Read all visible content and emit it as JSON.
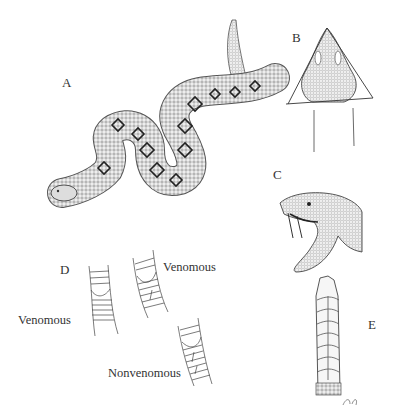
{
  "figure": {
    "panels": {
      "A": {
        "label": "A",
        "description": "Rattlesnake full body, coiled S-shape with diamond pattern"
      },
      "B": {
        "label": "B",
        "description": "Triangular head, dorsal view"
      },
      "C": {
        "label": "C",
        "description": "Head with open mouth showing fangs"
      },
      "D": {
        "label": "D",
        "description": "Ventral scale patterns near tail"
      },
      "E": {
        "label": "E",
        "description": "Rattle segments"
      }
    },
    "annotations": {
      "venomous_left": "Venomous",
      "venomous_right": "Venomous",
      "nonvenomous": "Nonvenomous"
    }
  }
}
